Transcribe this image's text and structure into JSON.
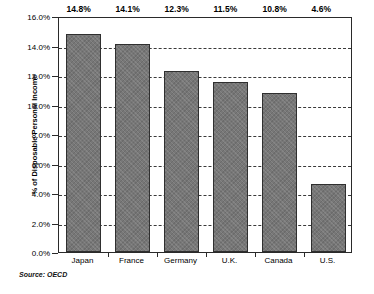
{
  "chart_data": {
    "type": "bar",
    "title": "",
    "xlabel": "",
    "ylabel": "% of Disposable Personal Income",
    "categories": [
      "Japan",
      "France",
      "Germany",
      "U.K.",
      "Canada",
      "U.S."
    ],
    "values": [
      14.8,
      14.1,
      12.3,
      11.5,
      10.8,
      4.6
    ],
    "value_labels": [
      "14.8%",
      "14.1%",
      "12.3%",
      "11.5%",
      "10.8%",
      "4.6%"
    ],
    "ylim": [
      0,
      16
    ],
    "ytick_values": [
      0,
      2,
      4,
      6,
      8,
      10,
      12,
      14,
      16
    ],
    "ytick_labels": [
      "0.0%",
      "2.0%",
      "4.0%",
      "6.0%",
      "8.0%",
      "10.0%",
      "12.0%",
      "14.0%",
      "16.0%"
    ],
    "grid": "horizontal-dashed",
    "legend": "none",
    "bar_color": "#777777",
    "bar_border_color": "#2f2f2f",
    "frame_color": "#2a2a2a",
    "grid_color": "#3a3a3a"
  },
  "source": {
    "text": "Source: OECD"
  }
}
